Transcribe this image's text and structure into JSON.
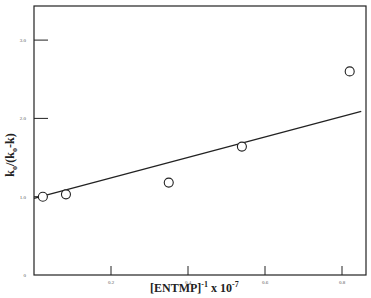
{
  "chart_data": {
    "type": "scatter",
    "title": "",
    "xlabel": "[ENTMP]^-1 x 10^-7",
    "xlabel_parts": {
      "main": "[ENTMP]",
      "sup1": "-1",
      "mid": " x 10",
      "sup2": "-7"
    },
    "ylabel": "k_o/(k_o-k)",
    "ylabel_parts": {
      "k1": "k",
      "sub1": "o",
      "mid": "/(k",
      "sub2": "o",
      "end": "-k)"
    },
    "xlim": [
      0,
      0.86
    ],
    "ylim": [
      0,
      3.4
    ],
    "x_ticks": [
      0.2,
      0.4,
      0.6,
      0.8
    ],
    "x_tick_labels": [
      "0.2",
      "0.4",
      "0.6",
      "0.8"
    ],
    "y_ticks": [
      0,
      1.0,
      2.0,
      3.0
    ],
    "y_tick_labels": [
      "0",
      "1.0",
      "2.0",
      "3.0"
    ],
    "grid": false,
    "legend": null,
    "series": [
      {
        "name": "data",
        "marker": "open-circle",
        "x": [
          0.023,
          0.083,
          0.35,
          0.54,
          0.82
        ],
        "y": [
          1.0,
          1.03,
          1.18,
          1.64,
          2.6
        ]
      },
      {
        "name": "linear fit",
        "style": "line",
        "x": [
          0.0,
          0.85
        ],
        "y": [
          0.98,
          2.09
        ]
      }
    ]
  },
  "colors": {
    "ink": "#222222",
    "background": "#ffffff"
  }
}
